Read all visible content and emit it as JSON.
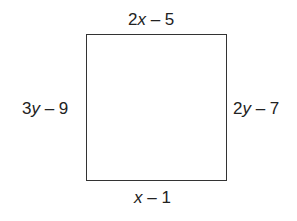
{
  "diagram": {
    "shape": "rectangle",
    "labels": {
      "top": {
        "coef": "2",
        "var": "x",
        "rest": " – 5"
      },
      "left": {
        "coef": "3",
        "var": "y",
        "rest": " – 9"
      },
      "right": {
        "coef": "2",
        "var": "y",
        "rest": " – 7"
      },
      "bottom": {
        "coef": "",
        "var": "x",
        "rest": " – 1"
      }
    }
  }
}
